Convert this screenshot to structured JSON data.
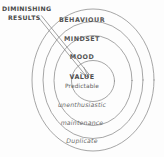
{
  "diagram": {
    "background_color": "#fdfdfd",
    "stroke_color": "#8a8a8a",
    "text_color": "#555555",
    "callout": {
      "line1": "DIMINISHING",
      "line2": "RESULTS",
      "arrow_name": "diminishing-results-arrow",
      "arrow_points_to": "VALUE"
    },
    "rings": [
      {
        "label": "BEHAVIOUR",
        "position": "top",
        "ring_index": 4,
        "style": "upper"
      },
      {
        "label": "MINDSET",
        "position": "top",
        "ring_index": 3,
        "style": "upper"
      },
      {
        "label": "MOOD",
        "position": "top",
        "ring_index": 2,
        "style": "upper"
      },
      {
        "label": "unenthusiastic",
        "position": "bottom",
        "ring_index": 2,
        "style": "lower"
      },
      {
        "label": "maintenance",
        "position": "bottom",
        "ring_index": 3,
        "style": "lower"
      },
      {
        "label": "Duplicate",
        "position": "bottom",
        "ring_index": 4,
        "style": "lower"
      }
    ],
    "center": {
      "label": "VALUE",
      "sublabel": "Predictable"
    }
  }
}
